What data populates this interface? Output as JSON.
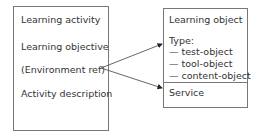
{
  "left_box": {
    "items": [
      "Learning activity",
      "Learning objective",
      "(Environment ref)",
      "Activity description"
    ]
  },
  "right_box": {
    "title": "Learning object",
    "type_label": "Type:",
    "types": [
      "— test-object",
      "— tool-object",
      "— content-object"
    ],
    "service": "Service"
  },
  "colors": {
    "line": "#555555",
    "border": "#777777",
    "text": "#333333"
  }
}
